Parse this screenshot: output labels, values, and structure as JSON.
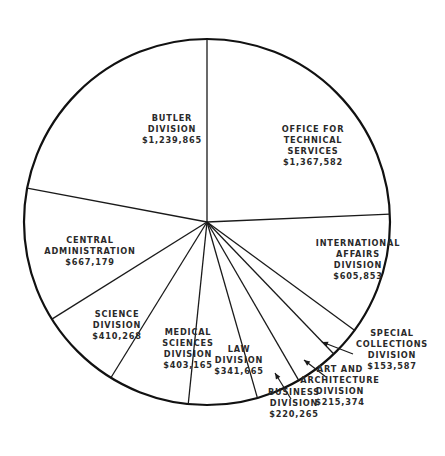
{
  "chart_data": {
    "type": "pie",
    "title": "",
    "start_angle": "12 o'clock",
    "direction": "clockwise",
    "slices": [
      {
        "name": "Office for Technical Services",
        "label_lines": [
          "OFFICE FOR",
          "TECHNICAL",
          "SERVICES",
          "$1,367,582"
        ],
        "value": 1367582
      },
      {
        "name": "International Affairs Division",
        "label_lines": [
          "INTERNATIONAL",
          "AFFAIRS",
          "DIVISION",
          "$605,853"
        ],
        "value": 605853
      },
      {
        "name": "Special Collections Division",
        "label_lines": [
          "SPECIAL",
          "COLLECTIONS",
          "DIVISION",
          "$153,587"
        ],
        "value": 153587
      },
      {
        "name": "Art and Architecture Division",
        "label_lines": [
          "ART AND",
          "ARCHITECTURE",
          "DIVISION",
          "$215,374"
        ],
        "value": 215374
      },
      {
        "name": "Business Division",
        "label_lines": [
          "BUSINESS",
          "DIVISION",
          "$220,265"
        ],
        "value": 220265
      },
      {
        "name": "Law Division",
        "label_lines": [
          "LAW",
          "DIVISION",
          "$341,665"
        ],
        "value": 341665
      },
      {
        "name": "Medical Sciences Division",
        "label_lines": [
          "MEDICAL",
          "SCIENCES",
          "DIVISION",
          "$403,165"
        ],
        "value": 403165
      },
      {
        "name": "Science Division",
        "label_lines": [
          "SCIENCE",
          "DIVISION",
          "$410,268"
        ],
        "value": 410268
      },
      {
        "name": "Central Administration",
        "label_lines": [
          "CENTRAL",
          "ADMINISTRATION",
          "$667,179"
        ],
        "value": 667179
      },
      {
        "name": "Butler Division",
        "label_lines": [
          "BUTLER",
          "DIVISION",
          "$1,239,865"
        ],
        "value": 1239865
      }
    ]
  },
  "layout": {
    "center": [
      207,
      222
    ],
    "radius": 183,
    "label_positions": [
      [
        313,
        145
      ],
      [
        358,
        259
      ],
      [
        392,
        349
      ],
      [
        340,
        385
      ],
      [
        294,
        403
      ],
      [
        239,
        360
      ],
      [
        188,
        348
      ],
      [
        117,
        325
      ],
      [
        90,
        251
      ],
      [
        172,
        129
      ]
    ],
    "arrows": [
      {
        "slice": 2,
        "from": [
          353,
          354
        ],
        "to": [
          322,
          342
        ]
      },
      {
        "slice": 3,
        "from": [
          326,
          377
        ],
        "to": [
          304,
          360
        ]
      },
      {
        "slice": 4,
        "from": [
          291,
          399
        ],
        "to": [
          275,
          373
        ]
      }
    ]
  }
}
